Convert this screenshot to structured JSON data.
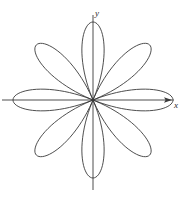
{
  "figure": {
    "background_color": "#ffffff",
    "width": 185,
    "height": 200
  },
  "axes": {
    "x_label": "x",
    "y_label": "y",
    "origin": {
      "x": 93,
      "y": 100
    },
    "x_axis": {
      "start_x": 2,
      "end_x": 172,
      "y": 100
    },
    "y_axis": {
      "x": 93,
      "start_y": 15,
      "end_y": 190
    },
    "axis_color": "#3a3a3a",
    "axis_width": 0.9,
    "arrow_x": true,
    "arrow_y": false
  },
  "chart_data": {
    "type": "line",
    "title": "",
    "subtitle": "",
    "xlabel": "x",
    "ylabel": "y",
    "grid": false,
    "legend": null,
    "coordinate_system": "polar",
    "curve_name": "eight-petal rose",
    "equation": "r = a cos(4θ)",
    "petal_count": 8,
    "petal_angles_deg": [
      0,
      45,
      90,
      135,
      180,
      225,
      270,
      315
    ],
    "amplitude_px": 80,
    "amplitude_minor_px": 78,
    "curve_color": "#3a3a3a",
    "curve_width": 0.9,
    "xlim": [
      -1.16,
      0.99
    ],
    "ylim": [
      -1.13,
      1.06
    ],
    "series": [
      {
        "name": "r = a cos(4θ)",
        "theta_step_deg": 1,
        "r_formula": "a*cos(4*theta)",
        "a": 1.0
      }
    ],
    "annotations": []
  }
}
